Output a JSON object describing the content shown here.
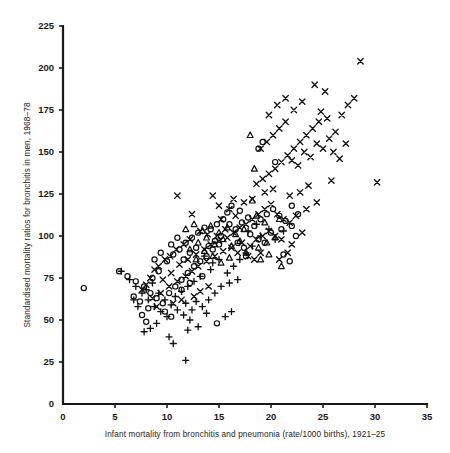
{
  "figure": {
    "background": "#ffffff",
    "ink": "#111111"
  },
  "chart_data": {
    "type": "scatter",
    "title": "",
    "xlabel": "Infant mortality from bronchitis and pneumonia (rate/1000 births), 1921–25",
    "ylabel": "Standardised mortality ratios for bronchitis in men, 1968–78",
    "xlim": [
      0,
      35
    ],
    "ylim": [
      0,
      225
    ],
    "xticks": [
      0,
      5,
      10,
      15,
      20,
      25,
      30,
      35
    ],
    "xticklabels": [
      "0",
      "5",
      "10",
      "15",
      "20",
      "25",
      "30",
      "35"
    ],
    "yticks": [
      0,
      25,
      50,
      75,
      100,
      125,
      150,
      175,
      200,
      225
    ],
    "yticklabels": [
      "0",
      "25",
      "50",
      "75",
      "100",
      "125",
      "150",
      "175",
      "200",
      "225"
    ],
    "grid": false,
    "legend": "none",
    "series": [
      {
        "name": "cross",
        "marker": "x",
        "points": [
          [
            11.0,
            124
          ],
          [
            14.4,
            124
          ],
          [
            12.4,
            113
          ],
          [
            15.2,
            110
          ],
          [
            16.0,
            116
          ],
          [
            16.6,
            112
          ],
          [
            15.6,
            104
          ],
          [
            14.8,
            100
          ],
          [
            13.9,
            101
          ],
          [
            13.2,
            103
          ],
          [
            12.2,
            98
          ],
          [
            11.6,
            95
          ],
          [
            10.9,
            92
          ],
          [
            10.3,
            88
          ],
          [
            9.8,
            86
          ],
          [
            9.2,
            82
          ],
          [
            8.8,
            80
          ],
          [
            8.4,
            75
          ],
          [
            8.0,
            71
          ],
          [
            7.6,
            68
          ],
          [
            9.6,
            74
          ],
          [
            10.4,
            78
          ],
          [
            11.2,
            83
          ],
          [
            12.0,
            86
          ],
          [
            12.8,
            89
          ],
          [
            13.6,
            92
          ],
          [
            14.2,
            95
          ],
          [
            15.0,
            97
          ],
          [
            15.8,
            99
          ],
          [
            16.4,
            102
          ],
          [
            17.0,
            105
          ],
          [
            17.6,
            107
          ],
          [
            18.2,
            110
          ],
          [
            18.8,
            113
          ],
          [
            19.4,
            116
          ],
          [
            20.0,
            119
          ],
          [
            20.6,
            113
          ],
          [
            21.2,
            110
          ],
          [
            21.8,
            108
          ],
          [
            22.4,
            112
          ],
          [
            17.2,
            96
          ],
          [
            18.0,
            94
          ],
          [
            18.6,
            98
          ],
          [
            19.2,
            100
          ],
          [
            19.8,
            103
          ],
          [
            20.4,
            100
          ],
          [
            21.0,
            98
          ],
          [
            17.8,
            88
          ],
          [
            18.4,
            86
          ],
          [
            19.0,
            90
          ],
          [
            16.8,
            90
          ],
          [
            16.2,
            93
          ],
          [
            15.4,
            91
          ],
          [
            14.6,
            88
          ],
          [
            13.8,
            85
          ],
          [
            13.0,
            82
          ],
          [
            12.4,
            79
          ],
          [
            11.8,
            76
          ],
          [
            11.0,
            73
          ],
          [
            10.2,
            70
          ],
          [
            9.4,
            66
          ],
          [
            8.6,
            63
          ],
          [
            18.6,
            131
          ],
          [
            19.2,
            134
          ],
          [
            19.8,
            137
          ],
          [
            20.4,
            140
          ],
          [
            21.0,
            144
          ],
          [
            21.6,
            148
          ],
          [
            22.2,
            152
          ],
          [
            22.8,
            156
          ],
          [
            23.4,
            160
          ],
          [
            24.0,
            164
          ],
          [
            24.6,
            168
          ],
          [
            19.0,
            152
          ],
          [
            19.6,
            156
          ],
          [
            20.2,
            160
          ],
          [
            20.8,
            164
          ],
          [
            21.4,
            168
          ],
          [
            22.0,
            145
          ],
          [
            22.6,
            142
          ],
          [
            23.2,
            150
          ],
          [
            23.8,
            147
          ],
          [
            24.4,
            155
          ],
          [
            25.0,
            152
          ],
          [
            25.6,
            158
          ],
          [
            26.2,
            162
          ],
          [
            26.8,
            172
          ],
          [
            27.4,
            178
          ],
          [
            28.0,
            182
          ],
          [
            28.6,
            204
          ],
          [
            25.2,
            186
          ],
          [
            24.2,
            190
          ],
          [
            23.0,
            180
          ],
          [
            22.2,
            175
          ],
          [
            21.4,
            182
          ],
          [
            20.6,
            178
          ],
          [
            19.8,
            172
          ],
          [
            24.8,
            174
          ],
          [
            25.4,
            170
          ],
          [
            26.0,
            150
          ],
          [
            26.6,
            146
          ],
          [
            27.2,
            155
          ],
          [
            30.2,
            132
          ],
          [
            25.8,
            133
          ],
          [
            23.6,
            130
          ],
          [
            22.8,
            126
          ],
          [
            21.8,
            124
          ],
          [
            20.2,
            128
          ],
          [
            19.4,
            126
          ],
          [
            18.2,
            122
          ],
          [
            17.4,
            120
          ],
          [
            16.4,
            122
          ],
          [
            15.0,
            118
          ],
          [
            23.4,
            116
          ],
          [
            24.4,
            120
          ],
          [
            22.0,
            95
          ],
          [
            23.0,
            102
          ],
          [
            21.6,
            90
          ],
          [
            20.8,
            86
          ],
          [
            14.0,
            70
          ],
          [
            13.2,
            67
          ],
          [
            12.6,
            64
          ],
          [
            11.4,
            62
          ],
          [
            10.6,
            60
          ],
          [
            9.0,
            58
          ]
        ]
      },
      {
        "name": "circle",
        "marker": "o",
        "points": [
          [
            2.0,
            69
          ],
          [
            5.4,
            79
          ],
          [
            6.2,
            76
          ],
          [
            7.0,
            73
          ],
          [
            7.8,
            70
          ],
          [
            8.4,
            66
          ],
          [
            9.0,
            63
          ],
          [
            9.6,
            60
          ],
          [
            8.2,
            57
          ],
          [
            7.4,
            61
          ],
          [
            6.8,
            64
          ],
          [
            10.2,
            66
          ],
          [
            10.8,
            70
          ],
          [
            11.4,
            74
          ],
          [
            12.0,
            78
          ],
          [
            12.6,
            82
          ],
          [
            13.2,
            85
          ],
          [
            13.8,
            88
          ],
          [
            14.4,
            92
          ],
          [
            15.0,
            95
          ],
          [
            10.0,
            85
          ],
          [
            10.6,
            89
          ],
          [
            11.2,
            92
          ],
          [
            11.8,
            96
          ],
          [
            12.4,
            99
          ],
          [
            13.0,
            102
          ],
          [
            13.6,
            105
          ],
          [
            14.2,
            104
          ],
          [
            14.8,
            107
          ],
          [
            15.4,
            110
          ],
          [
            16.0,
            107
          ],
          [
            16.6,
            104
          ],
          [
            17.2,
            108
          ],
          [
            17.8,
            111
          ],
          [
            18.4,
            106
          ],
          [
            19.0,
            110
          ],
          [
            19.6,
            113
          ],
          [
            20.2,
            116
          ],
          [
            20.8,
            112
          ],
          [
            21.4,
            109
          ],
          [
            22.0,
            106
          ],
          [
            22.6,
            113
          ],
          [
            18.0,
            101
          ],
          [
            18.8,
            98
          ],
          [
            19.4,
            96
          ],
          [
            20.0,
            102
          ],
          [
            21.0,
            104
          ],
          [
            16.2,
            118
          ],
          [
            17.0,
            115
          ],
          [
            15.8,
            114
          ],
          [
            15.2,
            100
          ],
          [
            14.6,
            97
          ],
          [
            14.0,
            94
          ],
          [
            9.4,
            90
          ],
          [
            10.4,
            95
          ],
          [
            11.0,
            99
          ],
          [
            11.6,
            86
          ],
          [
            12.2,
            90
          ],
          [
            12.8,
            93
          ],
          [
            8.8,
            86
          ],
          [
            9.2,
            79
          ],
          [
            8.6,
            75
          ],
          [
            7.6,
            53
          ],
          [
            8.0,
            49
          ],
          [
            9.8,
            55
          ],
          [
            10.4,
            52
          ],
          [
            14.8,
            48
          ],
          [
            21.2,
            89
          ],
          [
            21.8,
            85
          ],
          [
            19.2,
            156
          ],
          [
            18.8,
            152
          ],
          [
            20.4,
            144
          ],
          [
            17.6,
            88
          ],
          [
            13.4,
            76
          ],
          [
            12.2,
            72
          ],
          [
            11.4,
            68
          ],
          [
            16.8,
            96
          ],
          [
            17.4,
            93
          ],
          [
            22.4,
            100
          ],
          [
            22.0,
            118
          ]
        ]
      },
      {
        "name": "plus",
        "marker": "+",
        "points": [
          [
            5.6,
            79
          ],
          [
            6.4,
            74
          ],
          [
            7.0,
            70
          ],
          [
            7.6,
            66
          ],
          [
            8.2,
            62
          ],
          [
            8.8,
            58
          ],
          [
            9.4,
            55
          ],
          [
            10.0,
            52
          ],
          [
            7.2,
            58
          ],
          [
            6.8,
            62
          ],
          [
            8.0,
            68
          ],
          [
            8.6,
            72
          ],
          [
            9.2,
            66
          ],
          [
            9.8,
            62
          ],
          [
            10.4,
            59
          ],
          [
            11.0,
            56
          ],
          [
            11.6,
            53
          ],
          [
            12.2,
            50
          ],
          [
            9.0,
            48
          ],
          [
            8.4,
            45
          ],
          [
            7.8,
            43
          ],
          [
            10.8,
            64
          ],
          [
            11.4,
            67
          ],
          [
            12.0,
            70
          ],
          [
            12.6,
            73
          ],
          [
            13.2,
            76
          ],
          [
            12.8,
            61
          ],
          [
            13.4,
            58
          ],
          [
            14.0,
            62
          ],
          [
            14.6,
            66
          ],
          [
            15.2,
            70
          ],
          [
            13.8,
            54
          ],
          [
            12.4,
            56
          ],
          [
            11.8,
            60
          ],
          [
            10.2,
            40
          ],
          [
            10.6,
            36
          ],
          [
            11.8,
            26
          ],
          [
            14.2,
            80
          ],
          [
            15.8,
            78
          ],
          [
            16.4,
            82
          ],
          [
            17.0,
            86
          ],
          [
            17.6,
            90
          ],
          [
            18.2,
            94
          ],
          [
            16.8,
            74
          ],
          [
            16.0,
            72
          ],
          [
            15.0,
            86
          ],
          [
            14.4,
            84
          ],
          [
            13.6,
            88
          ],
          [
            19.0,
            100
          ],
          [
            19.8,
            104
          ],
          [
            20.4,
            98
          ],
          [
            18.6,
            107
          ],
          [
            17.8,
            103
          ],
          [
            21.2,
            103
          ],
          [
            12.0,
            44
          ],
          [
            13.0,
            46
          ],
          [
            15.6,
            52
          ],
          [
            16.2,
            55
          ]
        ]
      },
      {
        "name": "triangle",
        "marker": "^",
        "points": [
          [
            11.8,
            104
          ],
          [
            12.6,
            107
          ],
          [
            13.4,
            103
          ],
          [
            14.2,
            106
          ],
          [
            15.0,
            102
          ],
          [
            15.8,
            105
          ],
          [
            16.6,
            101
          ],
          [
            17.4,
            104
          ],
          [
            13.0,
            96
          ],
          [
            13.8,
            99
          ],
          [
            14.6,
            95
          ],
          [
            15.4,
            98
          ],
          [
            16.2,
            94
          ],
          [
            17.0,
            97
          ],
          [
            12.2,
            92
          ],
          [
            18.0,
            160
          ],
          [
            18.4,
            140
          ],
          [
            18.2,
            121
          ],
          [
            17.6,
            90
          ],
          [
            18.8,
            93
          ],
          [
            19.6,
            96
          ],
          [
            20.4,
            99
          ],
          [
            19.0,
            86
          ],
          [
            19.8,
            89
          ],
          [
            21.0,
            82
          ],
          [
            16.0,
            87
          ],
          [
            15.2,
            84
          ],
          [
            14.4,
            88
          ],
          [
            13.6,
            91
          ],
          [
            12.8,
            86
          ],
          [
            20.8,
            110
          ],
          [
            19.4,
            108
          ],
          [
            18.6,
            112
          ]
        ]
      }
    ]
  }
}
